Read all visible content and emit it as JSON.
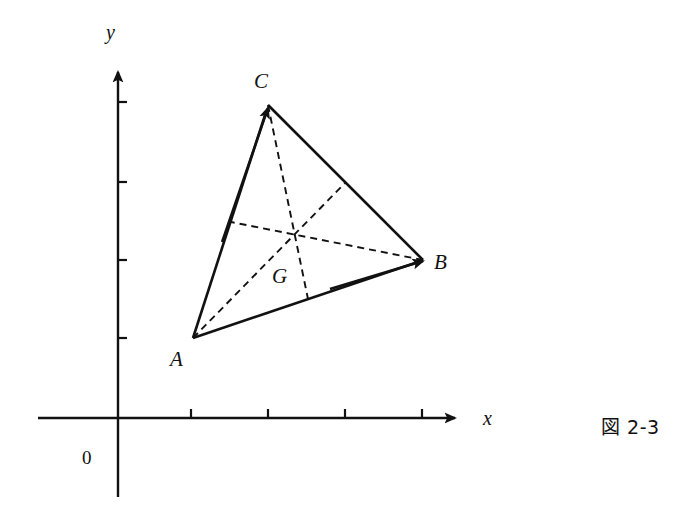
{
  "figure": {
    "caption": "図 2-3",
    "background_color": "#ffffff",
    "stroke_color": "#111111",
    "width": 687,
    "height": 513
  },
  "axes": {
    "x_label": "x",
    "y_label": "y",
    "origin_label": "0",
    "origin": {
      "x": 118,
      "y": 418
    },
    "x_axis": {
      "start_x": 38,
      "end_x": 462,
      "y": 418,
      "arrow": true
    },
    "y_axis": {
      "x": 118,
      "top_y": 66,
      "bottom_y": 497,
      "arrow": true
    },
    "x_ticks": [
      191,
      268,
      345,
      422
    ],
    "y_ticks": [
      102,
      182,
      260,
      338
    ],
    "tick_length": 9
  },
  "triangle": {
    "vertices": [
      {
        "name": "A",
        "x": 193,
        "y": 338,
        "label_x": 170,
        "label_y": 349
      },
      {
        "name": "B",
        "x": 423,
        "y": 260,
        "label_x": 434,
        "label_y": 252
      },
      {
        "name": "C",
        "x": 268,
        "y": 105,
        "label_x": 254,
        "label_y": 71
      }
    ],
    "position_vectors": [
      {
        "name": "vector-OA",
        "from": "origin",
        "to": "A",
        "arrow": true
      },
      {
        "name": "vector-OB",
        "from": "origin",
        "to": "B",
        "arrow": true
      },
      {
        "name": "vector-OC",
        "from": "origin",
        "to": "C",
        "arrow": true
      }
    ],
    "sides": [
      {
        "name": "side-AB",
        "from": "A",
        "to": "B"
      },
      {
        "name": "side-BC",
        "from": "B",
        "to": "C"
      },
      {
        "name": "side-CA",
        "from": "C",
        "to": "A"
      }
    ]
  },
  "centroid": {
    "name": "G",
    "x": 295,
    "y": 234,
    "label": "G",
    "label_x": 272,
    "label_y": 266
  },
  "midpoints": [
    {
      "name": "midpoint-AB",
      "x": 308,
      "y": 299
    },
    {
      "name": "midpoint-BC",
      "x": 345,
      "y": 183
    },
    {
      "name": "midpoint-CA",
      "x": 231,
      "y": 222
    }
  ],
  "medians": [
    {
      "name": "median-A-to-midBC",
      "from_x": 193,
      "from_y": 338,
      "to_x": 345,
      "to_y": 183
    },
    {
      "name": "median-B-to-midCA",
      "from_x": 423,
      "from_y": 260,
      "to_x": 231,
      "to_y": 222
    },
    {
      "name": "median-C-to-midAB",
      "from_x": 268,
      "from_y": 105,
      "to_x": 308,
      "to_y": 299
    }
  ],
  "style": {
    "solid_width": 2.4,
    "dash_width": 1.9,
    "dash_pattern": "7,5",
    "axis_width": 2.4
  }
}
